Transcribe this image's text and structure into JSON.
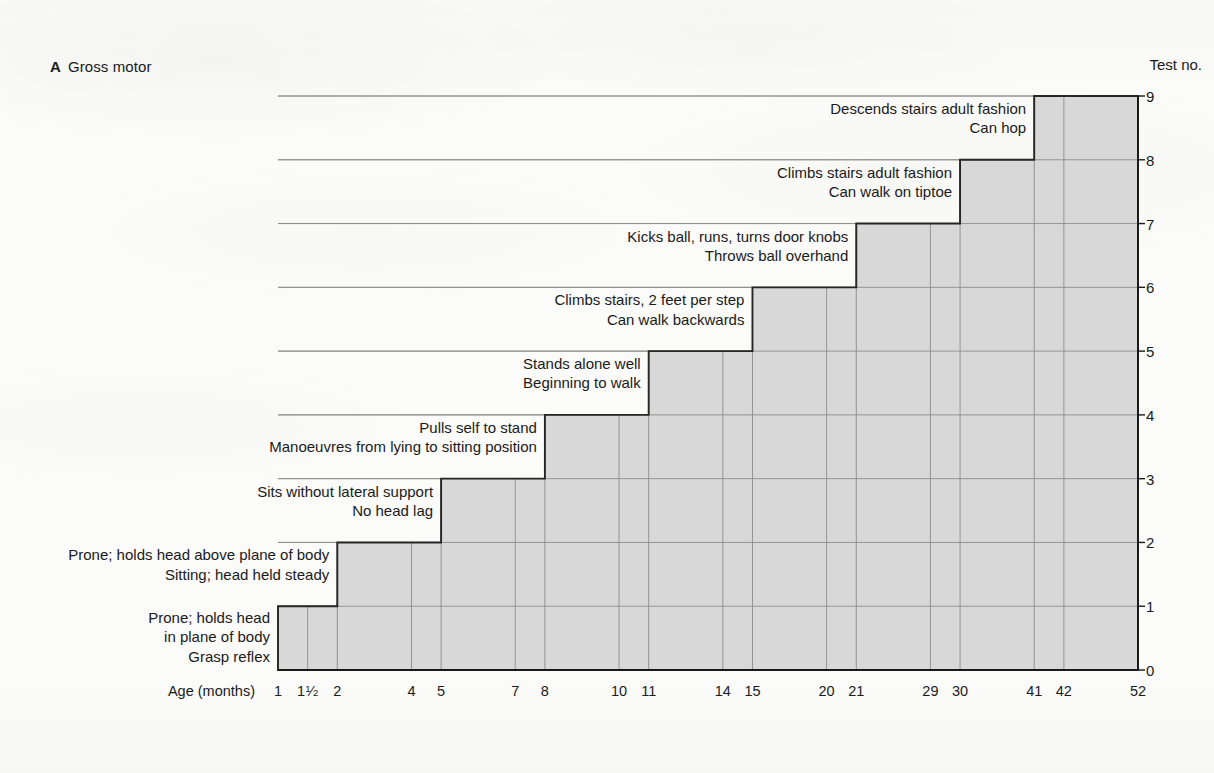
{
  "panel": {
    "letter": "A",
    "title": "Gross motor"
  },
  "axes": {
    "y_axis_title": "Test no.",
    "y_ticks": [
      "0",
      "1",
      "2",
      "3",
      "4",
      "5",
      "6",
      "7",
      "8",
      "9"
    ],
    "y_min": 0,
    "y_max": 9,
    "x_axis_title": "Age (months)",
    "x_ticks": [
      {
        "label": "1",
        "value": 1
      },
      {
        "label": "1½",
        "value": 1.5,
        "whole": "1",
        "num": "1",
        "den": "2"
      },
      {
        "label": "2",
        "value": 2
      },
      {
        "label": "4",
        "value": 4
      },
      {
        "label": "5",
        "value": 5
      },
      {
        "label": "7",
        "value": 7
      },
      {
        "label": "8",
        "value": 8
      },
      {
        "label": "10",
        "value": 10
      },
      {
        "label": "11",
        "value": 11
      },
      {
        "label": "14",
        "value": 14
      },
      {
        "label": "15",
        "value": 15
      },
      {
        "label": "20",
        "value": 20
      },
      {
        "label": "21",
        "value": 21
      },
      {
        "label": "29",
        "value": 29
      },
      {
        "label": "30",
        "value": 30
      },
      {
        "label": "41",
        "value": 41
      },
      {
        "label": "42",
        "value": 42
      },
      {
        "label": "52",
        "value": 52
      }
    ]
  },
  "colors": {
    "step_fill": "#d8d8d8",
    "step_outline": "#262626",
    "gridline": "#8c8c8c",
    "axis": "#1a1a1a",
    "text": "#1a1a1a",
    "page_background": "#fbfbfa"
  },
  "chart_data": {
    "type": "bar",
    "title": "Gross motor",
    "xlabel": "Age (months)",
    "ylabel": "Test no.",
    "xlim": [
      1,
      52
    ],
    "ylim": [
      0,
      9
    ],
    "grid": true,
    "legend": "none",
    "note": "Cumulative staircase of gross motor developmental milestones; each step spans the age interval over which that test number is achieved.",
    "categories": [
      "1",
      "2",
      "3",
      "4",
      "5",
      "6",
      "7",
      "8",
      "9"
    ],
    "values": [
      1,
      2,
      3,
      4,
      5,
      6,
      7,
      8,
      9
    ],
    "steps": [
      {
        "test_no": 1,
        "height": 1,
        "age_start": 1,
        "age_end": 2,
        "internal_gridline_ages": [
          1.5
        ],
        "labels": [
          "Prone; holds head",
          "in plane of body",
          "Grasp reflex"
        ]
      },
      {
        "test_no": 2,
        "height": 2,
        "age_start": 2,
        "age_end": 5,
        "internal_gridline_ages": [
          4
        ],
        "labels": [
          "Prone; holds head above plane of body",
          "Sitting; head held steady"
        ]
      },
      {
        "test_no": 3,
        "height": 3,
        "age_start": 5,
        "age_end": 8,
        "internal_gridline_ages": [
          7
        ],
        "labels": [
          "Sits without lateral support",
          "No head lag"
        ]
      },
      {
        "test_no": 4,
        "height": 4,
        "age_start": 8,
        "age_end": 11,
        "internal_gridline_ages": [
          10
        ],
        "labels": [
          "Pulls self to stand",
          "Manoeuvres from lying to sitting position"
        ]
      },
      {
        "test_no": 5,
        "height": 5,
        "age_start": 11,
        "age_end": 15,
        "internal_gridline_ages": [
          14
        ],
        "labels": [
          "Stands alone well",
          "Beginning to walk"
        ]
      },
      {
        "test_no": 6,
        "height": 6,
        "age_start": 15,
        "age_end": 21,
        "internal_gridline_ages": [
          20
        ],
        "labels": [
          "Climbs stairs, 2 feet per step",
          "Can walk backwards"
        ]
      },
      {
        "test_no": 7,
        "height": 7,
        "age_start": 21,
        "age_end": 30,
        "internal_gridline_ages": [
          29
        ],
        "labels": [
          "Kicks ball, runs, turns door knobs",
          "Throws ball overhand"
        ]
      },
      {
        "test_no": 8,
        "height": 8,
        "age_start": 30,
        "age_end": 41,
        "internal_gridline_ages": [],
        "labels": [
          "Climbs stairs adult fashion",
          "Can walk on tiptoe"
        ]
      },
      {
        "test_no": 9,
        "height": 9,
        "age_start": 41,
        "age_end": 52,
        "internal_gridline_ages": [
          42
        ],
        "labels": [
          "Descends stairs adult fashion",
          "Can hop"
        ]
      }
    ]
  }
}
